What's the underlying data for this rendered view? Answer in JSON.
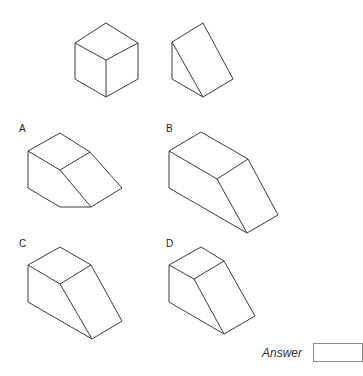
{
  "question": {
    "reference_shapes": [
      {
        "name": "cube"
      },
      {
        "name": "triangular-wedge"
      }
    ],
    "options": [
      {
        "label": "A"
      },
      {
        "label": "B"
      },
      {
        "label": "C"
      },
      {
        "label": "D"
      }
    ]
  },
  "answer": {
    "label": "Answer",
    "value": ""
  }
}
